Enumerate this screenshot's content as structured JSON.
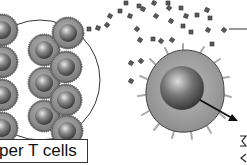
{
  "diagram": {
    "label": "per T cells",
    "full_label_guess_hidden": false,
    "elements": {
      "cluster": {
        "description": "circle containing stacked helper T cells",
        "cell_count_visible": 11
      },
      "cytokines": {
        "description": "small dark square particles",
        "color": "#555555"
      },
      "large_cell": {
        "description": "cell with nucleus and spiky membrane",
        "fill": "#9a9a9a",
        "nucleus": "#6a6a6a"
      },
      "arrow": {
        "description": "black arrow from nucleus pointing down-right"
      },
      "pointer_line": {
        "description": "line from right edge to cytokine particle"
      }
    },
    "colors": {
      "outline": "#333333",
      "cell_fill": "#8c8c8c",
      "background": "#ffffff"
    }
  }
}
